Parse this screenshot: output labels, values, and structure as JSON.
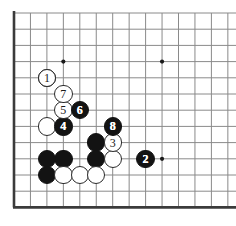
{
  "figure": {
    "type": "go-board-diagram",
    "title": "",
    "board": {
      "background_color": "#ffffff",
      "line_color": "#8a8a8a",
      "edge_color": "#3b3b3b",
      "star_point_color": "#1a1a1a",
      "origin_x": 14,
      "origin_y": 13,
      "spacing_x": 16.45,
      "spacing_y": 16.2,
      "cols": 14,
      "rows": 13,
      "left_edge_col": 0,
      "bottom_edge_row": 12,
      "star_points": [
        {
          "col": 3,
          "row": 3
        },
        {
          "col": 9,
          "row": 3
        },
        {
          "col": 9,
          "row": 9
        }
      ]
    },
    "stone_colors": {
      "black": "#131313",
      "white": "#ffffff",
      "white_outline": "#2b2b2b",
      "black_label": "#ffffff",
      "white_label": "#1a1a1a"
    },
    "stone_radius": 9.2,
    "stones": [
      {
        "col": 2,
        "row": 4,
        "color": "black",
        "label": ""
      },
      {
        "col": 3,
        "row": 9,
        "color": "black",
        "label": ""
      },
      {
        "col": 2,
        "row": 9,
        "color": "black",
        "label": ""
      },
      {
        "col": 2,
        "row": 10,
        "color": "black",
        "label": ""
      },
      {
        "col": 5,
        "row": 8,
        "color": "black",
        "label": ""
      },
      {
        "col": 5,
        "row": 9,
        "color": "black",
        "label": ""
      },
      {
        "col": 2,
        "row": 7,
        "color": "white",
        "label": ""
      },
      {
        "col": 3,
        "row": 10,
        "color": "white",
        "label": ""
      },
      {
        "col": 4,
        "row": 10,
        "color": "white",
        "label": ""
      },
      {
        "col": 5,
        "row": 10,
        "color": "white",
        "label": ""
      },
      {
        "col": 6,
        "row": 9,
        "color": "white",
        "label": ""
      }
    ],
    "numbered_moves": [
      {
        "move": "1",
        "col": 2,
        "row": 4,
        "color": "white"
      },
      {
        "move": "2",
        "col": 8,
        "row": 9,
        "color": "black"
      },
      {
        "move": "3",
        "col": 6,
        "row": 8,
        "color": "white"
      },
      {
        "move": "4",
        "col": 3,
        "row": 7,
        "color": "black"
      },
      {
        "move": "5",
        "col": 3,
        "row": 6,
        "color": "white"
      },
      {
        "move": "6",
        "col": 4,
        "row": 6,
        "color": "black"
      },
      {
        "move": "7",
        "col": 3,
        "row": 5,
        "color": "white"
      },
      {
        "move": "8",
        "col": 6,
        "row": 7,
        "color": "black"
      }
    ]
  }
}
